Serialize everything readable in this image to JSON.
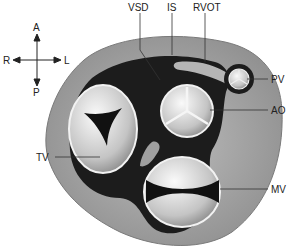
{
  "orientation": {
    "anterior": "A",
    "posterior": "P",
    "right": "R",
    "left": "L"
  },
  "labels": {
    "vsd": "VSD",
    "is": "IS",
    "rvot": "RVOT",
    "pv": "PV",
    "ao": "AO",
    "tv": "TV",
    "mv": "MV"
  },
  "colors": {
    "outer_tissue": "#a8a8a8",
    "dark_ring": "#1c1c1c",
    "valve_fill": "#d8d8d8",
    "valve_ring": "#f2f2f2",
    "leader_line": "#333333"
  }
}
